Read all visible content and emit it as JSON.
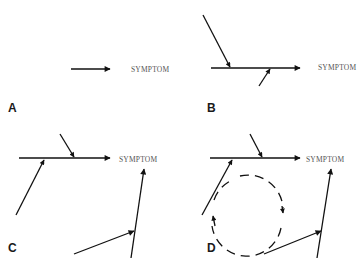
{
  "figure": {
    "type": "causal-pathway-diagram",
    "panels": [
      {
        "label": "A",
        "description": "Single cause leads to symptom",
        "symptom_text": "SYMPTOM"
      },
      {
        "label": "B",
        "description": "Main pathway with two contributing causes feeding into it",
        "symptom_text": "SYMPTOM"
      },
      {
        "label": "C",
        "description": "Two independent pathways, each with contributing causes, leading to symptom",
        "symptom_text": "SYMPTOM"
      },
      {
        "label": "D",
        "description": "Two pathways plus a feedback loop (dashed circular arrow)",
        "symptom_text": "SYMPTOM"
      }
    ],
    "colors": {
      "line": "#111111",
      "symptom_text": "#555555",
      "label": "#1a1a1a",
      "background": "#ffffff"
    }
  }
}
